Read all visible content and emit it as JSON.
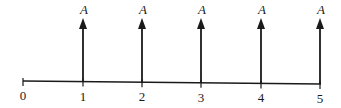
{
  "diagram": {
    "type": "cash-flow-diagram",
    "axis": {
      "x_start": 23,
      "x_end": 321,
      "y": 83,
      "color": "#1a1a1a"
    },
    "periods": [
      {
        "label": "0",
        "x": 23,
        "has_arrow": false,
        "arrow_label": ""
      },
      {
        "label": "1",
        "x": 83,
        "has_arrow": true,
        "arrow_label": "A"
      },
      {
        "label": "2",
        "x": 142,
        "has_arrow": true,
        "arrow_label": "A"
      },
      {
        "label": "3",
        "x": 201,
        "has_arrow": true,
        "arrow_label": "A"
      },
      {
        "label": "4",
        "x": 261,
        "has_arrow": true,
        "arrow_label": "A"
      },
      {
        "label": "5",
        "x": 320,
        "has_arrow": true,
        "arrow_label": "A"
      }
    ],
    "arrow_top_y": 18,
    "arrow_direction": "up"
  }
}
